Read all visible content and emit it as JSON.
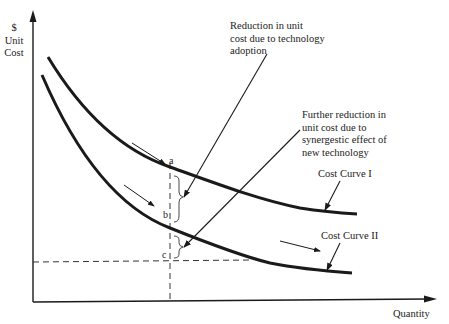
{
  "diagram": {
    "y_axis_label": [
      "$",
      "Unit",
      "Cost"
    ],
    "x_axis_label": "Quantity",
    "curves": [
      {
        "name": "Cost Curve I",
        "label": "Cost Curve I"
      },
      {
        "name": "Cost Curve II",
        "label": "Cost Curve II"
      }
    ],
    "points": {
      "a": "a",
      "b": "b",
      "c": "c"
    },
    "annotations": {
      "reduction_technology": [
        "Reduction in unit",
        "cost due to technology",
        "adoption"
      ],
      "reduction_synergy": [
        "Further reduction in",
        "unit cost due to",
        "synergestic effect of",
        "new technology"
      ]
    },
    "colors": {
      "line": "#1a1a1a",
      "background": "#ffffff"
    }
  }
}
